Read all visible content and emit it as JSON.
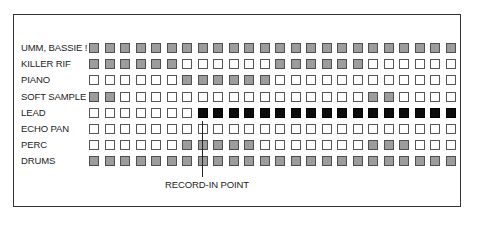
{
  "diagram": {
    "legend_codes": {
      "G": "active (gray)",
      "B": "recording (black)",
      "W": "empty (white)"
    },
    "colors": {
      "gray": "#9c9c9c",
      "black": "#0c0c0c",
      "white": "#ffffff",
      "border": "#555555"
    },
    "columns": 24,
    "tracks": [
      {
        "label": "UMM, BASSIE !",
        "cells": "GGGGGGGGGGGGGGGGGGGGGGGG"
      },
      {
        "label": "KILLER RIF",
        "cells": "GGGGGGWWWWWWGGGGGGWWWWWW"
      },
      {
        "label": "PIANO",
        "cells": "WWWWWWGGGGGGWWWWWWWWWWWW"
      },
      {
        "label": "SOFT SAMPLE",
        "cells": "GGWWWWWWWWWWWWWWWWGGWWWW"
      },
      {
        "label": "LEAD",
        "cells": "WWWWWWWBBBBBBBBBBBBBBBBB"
      },
      {
        "label": "ECHO PAN",
        "cells": "WWWWWWWWWWWWWWWWWWWWWWWW"
      },
      {
        "label": "PERC",
        "cells": "WWWWWWGGGGGWWWWWWWGGGWWW"
      },
      {
        "label": "DRUMS",
        "cells": "GGGGGGGGGGGGGGGGGGGGGGGG"
      }
    ],
    "marker": {
      "label": "RECORD-IN POINT",
      "column": 7
    }
  }
}
